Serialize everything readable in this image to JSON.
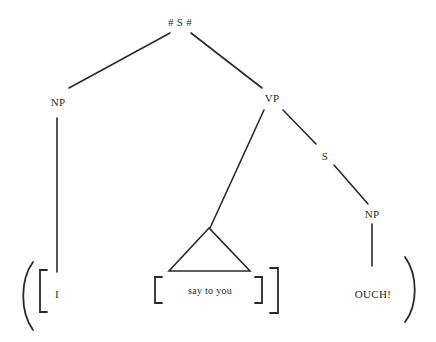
{
  "diagram": {
    "type": "syntax-tree",
    "nodes": {
      "root": "# S #",
      "subject_np": "NP",
      "vp": "VP",
      "embedded_s": "S",
      "object_np": "NP"
    },
    "leaves": {
      "subject": "I",
      "verb_phrase": "say to you",
      "quote": "OUCH!"
    },
    "colors": {
      "ink": "#2a2a2a",
      "background": "#ffffff"
    }
  }
}
